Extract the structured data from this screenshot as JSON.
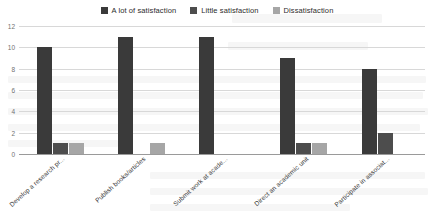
{
  "chart_data": {
    "type": "bar",
    "title": "",
    "subtitle": "",
    "xlabel": "",
    "ylabel": "",
    "ylim": [
      0,
      12
    ],
    "yticks": [
      0,
      2,
      4,
      6,
      8,
      10,
      12
    ],
    "grid": true,
    "legend_position": "top-center",
    "categories": [
      "Develop a research pr...",
      "Publish books/articles",
      "Submit work at acade...",
      "Direct an academic unit",
      "Participate in associat..."
    ],
    "series": [
      {
        "name": "A lot of satisfaction",
        "color": "#3a3a3a",
        "values": [
          10,
          11,
          11,
          9,
          8
        ]
      },
      {
        "name": "Little satisfaction",
        "color": "#4d4d4d",
        "values": [
          1,
          0,
          0,
          1,
          2
        ]
      },
      {
        "name": "Dissatisfaction",
        "color": "#a6a6a6",
        "values": [
          1,
          1,
          0,
          1,
          0
        ]
      }
    ]
  },
  "legend": {
    "items": [
      {
        "label": "A lot of satisfaction",
        "color": "#3a3a3a"
      },
      {
        "label": "Little satisfaction",
        "color": "#4d4d4d"
      },
      {
        "label": "Dissatisfaction",
        "color": "#a6a6a6"
      }
    ]
  },
  "axis": {
    "y_tick_labels": [
      "12",
      "10",
      "8",
      "6",
      "4",
      "2",
      "0"
    ]
  }
}
